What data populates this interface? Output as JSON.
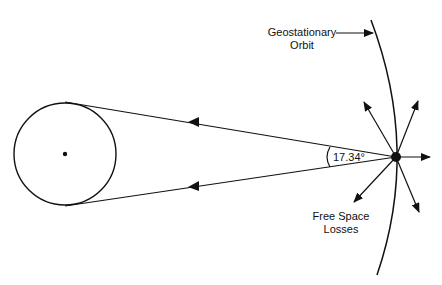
{
  "diagram": {
    "angle_label": "17.34°",
    "geo_orbit_label_line1": "Geostationary",
    "geo_orbit_label_line2": "Orbit",
    "losses_label_line1": "Free Space",
    "losses_label_line2": "Losses"
  },
  "colors": {
    "stroke": "#111111",
    "background": "#ffffff"
  }
}
